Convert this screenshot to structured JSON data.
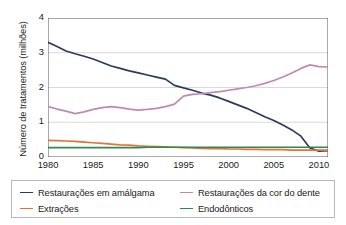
{
  "chart_data": {
    "type": "line",
    "title": "",
    "xlabel": "",
    "ylabel": "Número de tratamentos (milhões)",
    "xlim": [
      1980,
      2011
    ],
    "ylim": [
      0,
      4
    ],
    "xticks": [
      "1980",
      "1985",
      "1990",
      "1995",
      "2000",
      "2005",
      "2010"
    ],
    "xtick_values": [
      1980,
      1985,
      1990,
      1995,
      2000,
      2005,
      2010
    ],
    "yticks": [
      "0",
      "1",
      "2",
      "3",
      "4"
    ],
    "ytick_values": [
      0,
      1,
      2,
      3,
      4
    ],
    "grid": "horizontal",
    "legend_position": "bottom",
    "x": [
      1980,
      1981,
      1982,
      1983,
      1984,
      1985,
      1986,
      1987,
      1988,
      1989,
      1990,
      1991,
      1992,
      1993,
      1994,
      1995,
      1996,
      1997,
      1998,
      1999,
      2000,
      2001,
      2002,
      2003,
      2004,
      2005,
      2006,
      2007,
      2008,
      2009,
      2010,
      2011
    ],
    "series": [
      {
        "name": "Restaurações em amálgama",
        "color": "#2b3b5e",
        "values": [
          3.3,
          3.18,
          3.05,
          2.97,
          2.9,
          2.82,
          2.72,
          2.62,
          2.55,
          2.48,
          2.42,
          2.36,
          2.3,
          2.24,
          2.06,
          1.99,
          1.92,
          1.84,
          1.78,
          1.7,
          1.6,
          1.5,
          1.4,
          1.28,
          1.16,
          1.05,
          0.92,
          0.78,
          0.6,
          0.26,
          0.17,
          0.18
        ]
      },
      {
        "name": "Restaurações da cor do dente",
        "color": "#c089b4",
        "values": [
          1.45,
          1.38,
          1.32,
          1.25,
          1.3,
          1.37,
          1.42,
          1.45,
          1.42,
          1.38,
          1.35,
          1.37,
          1.4,
          1.45,
          1.52,
          1.75,
          1.8,
          1.82,
          1.85,
          1.88,
          1.92,
          1.96,
          2.0,
          2.05,
          2.12,
          2.2,
          2.3,
          2.42,
          2.55,
          2.65,
          2.6,
          2.59
        ]
      },
      {
        "name": "Extrações",
        "color": "#e8703a",
        "values": [
          0.48,
          0.47,
          0.46,
          0.45,
          0.43,
          0.41,
          0.39,
          0.37,
          0.35,
          0.34,
          0.32,
          0.31,
          0.3,
          0.29,
          0.28,
          0.27,
          0.26,
          0.25,
          0.24,
          0.24,
          0.23,
          0.23,
          0.22,
          0.22,
          0.21,
          0.21,
          0.21,
          0.2,
          0.2,
          0.2,
          0.2,
          0.2
        ]
      },
      {
        "name": "Endodônticos",
        "color": "#2f8a4e",
        "values": [
          0.27,
          0.27,
          0.27,
          0.27,
          0.27,
          0.27,
          0.27,
          0.27,
          0.27,
          0.27,
          0.27,
          0.28,
          0.28,
          0.28,
          0.28,
          0.28,
          0.28,
          0.28,
          0.28,
          0.28,
          0.28,
          0.28,
          0.28,
          0.28,
          0.28,
          0.28,
          0.28,
          0.28,
          0.28,
          0.28,
          0.28,
          0.28
        ]
      }
    ]
  },
  "legend": {
    "items": [
      {
        "label": "Restaurações em amálgama",
        "color": "#2b3b5e"
      },
      {
        "label": "Restaurações da cor do dente",
        "color": "#c089b4"
      },
      {
        "label": "Extrações",
        "color": "#e8703a"
      },
      {
        "label": "Endodônticos",
        "color": "#2f8a4e"
      }
    ]
  }
}
